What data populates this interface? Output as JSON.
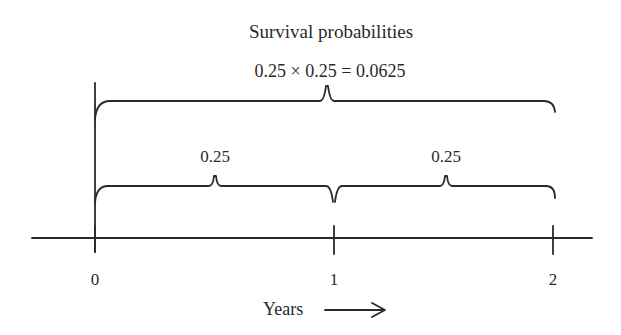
{
  "title": "Survival probabilities",
  "combined_formula": "0.25 × 0.25 = 0.0625",
  "segments": [
    {
      "label": "0.25",
      "from": 0,
      "to": 1
    },
    {
      "label": "0.25",
      "from": 1,
      "to": 2
    }
  ],
  "axis": {
    "ticks": [
      "0",
      "1",
      "2"
    ],
    "label": "Years",
    "arrow": "right-arrow"
  },
  "colors": {
    "line": "#2a2a2a",
    "background": "#ffffff"
  }
}
